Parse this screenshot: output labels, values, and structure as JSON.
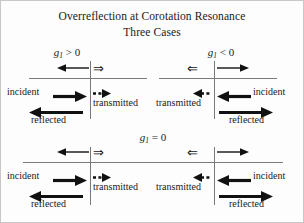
{
  "figure": {
    "title_main": "Overreflection at Corotation Resonance",
    "title_sub": "Three Cases",
    "background_color": "#fdfdfd",
    "line_color": "#7a7a7a",
    "text_color": "#1a1a1a"
  },
  "cases": [
    {
      "id": "positive",
      "label_var": "g",
      "label_sub": "1",
      "label_rel": "> 0",
      "label_full": "g₁ > 0",
      "position": "top-left"
    },
    {
      "id": "negative",
      "label_var": "g",
      "label_sub": "1",
      "label_rel": "< 0",
      "label_full": "g₁ < 0",
      "position": "top-right"
    },
    {
      "id": "zero",
      "label_var": "g",
      "label_sub": "1",
      "label_rel": "= 0",
      "label_full": "g₁ = 0",
      "position": "bottom-center"
    }
  ],
  "panels": {
    "top_left": {
      "incident_label": "incident",
      "transmitted_label": "transmitted",
      "reflected_label": "reflected",
      "flow_symbol": "⇒",
      "flow_symbol_name": "double-arrow-right"
    },
    "top_right": {
      "incident_label": "incident",
      "transmitted_label": "transmitted",
      "reflected_label": "reflected",
      "flow_symbol": "⇐",
      "flow_symbol_name": "double-arrow-left"
    },
    "bottom_left": {
      "incident_label": "incident",
      "transmitted_label": "transmitted",
      "reflected_label": "reflected",
      "flow_symbol": "⇒",
      "flow_symbol_name": "double-arrow-right"
    },
    "bottom_right": {
      "incident_label": "incident",
      "transmitted_label": "transmitted",
      "reflected_label": "reflected",
      "flow_symbol": "⇐",
      "flow_symbol_name": "double-arrow-left"
    }
  }
}
